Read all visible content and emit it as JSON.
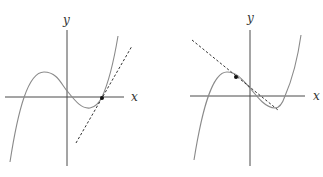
{
  "figure": {
    "panels": [
      {
        "id": "left",
        "axis_labels": {
          "x": "x",
          "y": "y"
        },
        "description": "Cubic curve with dashed tangent line at a point where the curve crosses the x-axis on the right",
        "tangent_point": "right x-intercept",
        "tangent_slope": "positive"
      },
      {
        "id": "right",
        "axis_labels": {
          "x": "x",
          "y": "y"
        },
        "description": "Cubic curve with dashed tangent line at a point left of the y-axis, descending slope",
        "tangent_point": "left of y-axis, on decreasing section",
        "tangent_slope": "negative"
      }
    ],
    "colors": {
      "axis": "#4a4a4a",
      "curve": "#8a8a8a",
      "tangent": "#333333",
      "point": "#111111"
    }
  }
}
